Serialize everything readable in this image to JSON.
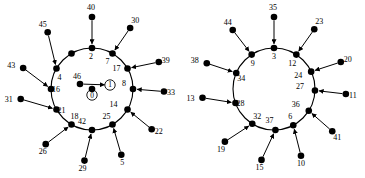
{
  "figure": {
    "title": "",
    "background": "#ffffff",
    "node_color": "#000000",
    "edge_color": "#000000",
    "type": "two-panel-node-link-wheel-diagram",
    "panel_count": 2
  },
  "chart_data": {
    "type": "diagram",
    "title": "",
    "xlabel": "",
    "ylabel": "",
    "panels": [
      {
        "name": "left-graph",
        "center_x": 92,
        "center_y": 89,
        "ring_radius": 41,
        "spoke_radius": 72,
        "ring_node_count": 12,
        "ring_nodes": [
          {
            "id": "2",
            "angle": -90,
            "label": "2",
            "label_dx": -1,
            "label_dy": 11
          },
          {
            "id": "7",
            "angle": -60,
            "label": "7",
            "label_dx": -5,
            "label_dy": 11
          },
          {
            "id": "17",
            "angle": -30,
            "label": "17",
            "label_dx": -11,
            "label_dy": 2
          },
          {
            "id": "8",
            "angle": 0,
            "label": "8",
            "label_dx": -9,
            "label_dy": -3
          },
          {
            "id": "14",
            "angle": 30,
            "label": "14",
            "label_dx": -14,
            "label_dy": -3
          },
          {
            "id": "25",
            "angle": 60,
            "label": "25",
            "label_dx": -6,
            "label_dy": -6
          },
          {
            "id": "42",
            "angle": 90,
            "label": "42",
            "label_dx": -10,
            "label_dy": -6
          },
          {
            "id": "18",
            "angle": 120,
            "label": "18",
            "label_dx": 3,
            "label_dy": -6
          },
          {
            "id": "21",
            "angle": 150,
            "label": "21",
            "label_dx": 5,
            "label_dy": 3
          },
          {
            "id": "16",
            "angle": 180,
            "label": "16",
            "label_dx": 5,
            "label_dy": 3
          },
          {
            "id": "4",
            "angle": -150,
            "label": "4",
            "label_dx": 3,
            "label_dy": 11
          },
          {
            "id": "-",
            "angle": -120,
            "label": "",
            "label_dx": 0,
            "label_dy": 0
          }
        ],
        "outer_nodes": [
          {
            "id": "40",
            "angle": -90,
            "label": "40",
            "attaches_to": "2",
            "label_dx": -1,
            "label_dy": -7
          },
          {
            "id": "30",
            "angle": -58,
            "label": "30",
            "attaches_to": "7",
            "label_dx": 5,
            "label_dy": -5
          },
          {
            "id": "39",
            "angle": -22,
            "label": "39",
            "attaches_to": "17",
            "label_dx": 7,
            "label_dy": 1
          },
          {
            "id": "33",
            "angle": 2,
            "label": "33",
            "attaches_to": "8",
            "label_dx": 7,
            "label_dy": 3
          },
          {
            "id": "22",
            "angle": 34,
            "label": "22",
            "attaches_to": "14",
            "label_dx": 7,
            "label_dy": 5
          },
          {
            "id": "5",
            "angle": 66,
            "label": "5",
            "attaches_to": "25",
            "label_dx": 1,
            "label_dy": 10
          },
          {
            "id": "29",
            "angle": 96,
            "label": "29",
            "attaches_to": "42",
            "label_dx": -2,
            "label_dy": 10
          },
          {
            "id": "26",
            "angle": 130,
            "label": "26",
            "attaches_to": "18",
            "label_dx": -3,
            "label_dy": 10
          },
          {
            "id": "31",
            "angle": 172,
            "label": "31",
            "attaches_to": "21",
            "label_dx": -12,
            "label_dy": 3
          },
          {
            "id": "43",
            "angle": -163,
            "label": "43",
            "attaches_to": "16",
            "label_dx": -12,
            "label_dy": 0
          },
          {
            "id": "45",
            "angle": -128,
            "label": "45",
            "attaches_to": "4",
            "label_dx": -5,
            "label_dy": -5
          }
        ],
        "inner_nodes": [
          {
            "id": "46",
            "x": 80,
            "y": 84,
            "label": "46",
            "label_dx": -3,
            "label_dy": -5,
            "circled": false
          },
          {
            "id": "1",
            "x": 110,
            "y": 85,
            "label": "1",
            "label_dx": 0,
            "label_dy": 2,
            "circled": true
          },
          {
            "id": "0",
            "x": 92,
            "y": 95,
            "label": "0",
            "label_dx": 0,
            "label_dy": 9,
            "circled": true
          }
        ],
        "inner_edges": [
          {
            "from": "46",
            "to": "1",
            "arrow": true
          }
        ]
      },
      {
        "name": "right-graph",
        "center_x": 274,
        "center_y": 89,
        "ring_radius": 41,
        "spoke_radius": 72,
        "ring_node_count": 11,
        "ring_nodes": [
          {
            "id": "3",
            "angle": -90,
            "label": "3",
            "label_dx": 0,
            "label_dy": 11
          },
          {
            "id": "12",
            "angle": -57,
            "label": "12",
            "label_dx": -4,
            "label_dy": 11
          },
          {
            "id": "24",
            "angle": -25,
            "label": "24",
            "label_dx": -13,
            "label_dy": 6
          },
          {
            "id": "27",
            "angle": 2,
            "label": "27",
            "label_dx": -15,
            "label_dy": -1
          },
          {
            "id": "36",
            "angle": 32,
            "label": "36",
            "label_dx": -13,
            "label_dy": -4
          },
          {
            "id": "6",
            "angle": 62,
            "label": "6",
            "label_dx": -3,
            "label_dy": -6
          },
          {
            "id": "37",
            "angle": 88,
            "label": "37",
            "label_dx": -6,
            "label_dy": -7
          },
          {
            "id": "32",
            "angle": 122,
            "label": "32",
            "label_dx": 5,
            "label_dy": -5
          },
          {
            "id": "28",
            "angle": 160,
            "label": "28",
            "label_dx": 5,
            "label_dy": 3
          },
          {
            "id": "34",
            "angle": -157,
            "label": "34",
            "label_dx": 5,
            "label_dy": 8
          },
          {
            "id": "9",
            "angle": -123,
            "label": "9",
            "label_dx": 1,
            "label_dy": 11
          }
        ],
        "outer_nodes": [
          {
            "id": "35",
            "angle": -90,
            "label": "35",
            "attaches_to": "3",
            "label_dx": -1,
            "label_dy": -7
          },
          {
            "id": "23",
            "angle": -56,
            "label": "23",
            "attaches_to": "12",
            "label_dx": 5,
            "label_dy": -5
          },
          {
            "id": "20",
            "angle": -22,
            "label": "20",
            "attaches_to": "24",
            "label_dx": 7,
            "label_dy": 0
          },
          {
            "id": "11",
            "angle": 4,
            "label": "11",
            "attaches_to": "27",
            "label_dx": 7,
            "label_dy": 4
          },
          {
            "id": "41",
            "angle": 36,
            "label": "41",
            "attaches_to": "36",
            "label_dx": 5,
            "label_dy": 9
          },
          {
            "id": "10",
            "angle": 68,
            "label": "10",
            "attaches_to": "6",
            "label_dx": 0,
            "label_dy": 10
          },
          {
            "id": "15",
            "angle": 100,
            "label": "15",
            "attaches_to": "37",
            "label_dx": -2,
            "label_dy": 10
          },
          {
            "id": "19",
            "angle": 133,
            "label": "19",
            "attaches_to": "32",
            "label_dx": -4,
            "label_dy": 10
          },
          {
            "id": "13",
            "angle": 173,
            "label": "13",
            "attaches_to": "28",
            "label_dx": -12,
            "label_dy": 3
          },
          {
            "id": "38",
            "angle": -159,
            "label": "38",
            "attaches_to": "34",
            "label_dx": -12,
            "label_dy": 0
          },
          {
            "id": "44",
            "angle": -125,
            "label": "44",
            "attaches_to": "9",
            "label_dx": -5,
            "label_dy": -5
          }
        ],
        "inner_nodes": [],
        "inner_edges": []
      }
    ],
    "all_node_labels": [
      "0",
      "1",
      "2",
      "3",
      "4",
      "5",
      "6",
      "7",
      "8",
      "9",
      "10",
      "11",
      "12",
      "13",
      "14",
      "15",
      "16",
      "17",
      "18",
      "19",
      "20",
      "21",
      "22",
      "23",
      "24",
      "25",
      "26",
      "27",
      "28",
      "29",
      "30",
      "31",
      "32",
      "33",
      "34",
      "35",
      "36",
      "37",
      "38",
      "39",
      "40",
      "41",
      "42",
      "43",
      "44",
      "45",
      "46"
    ]
  }
}
